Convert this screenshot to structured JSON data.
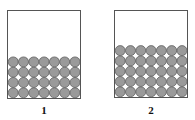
{
  "containers": [
    {
      "label": "1",
      "rows": 4,
      "cols": 7
    },
    {
      "label": "2",
      "rows": 5,
      "cols": 7
    }
  ],
  "colors": {
    "sphere_fill": "#9a9a9a",
    "sphere_stroke": "#555555",
    "border": "#555555"
  }
}
